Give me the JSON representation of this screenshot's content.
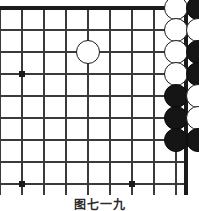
{
  "figure": {
    "kind": "go-board-diagram",
    "width": 199,
    "height": 211,
    "caption": "图七一九",
    "background_color": "#ffffff"
  },
  "board": {
    "line_color": "#3a3a3a",
    "edge_color": "#1a1a1a",
    "star_point_color": "#1a1a1a",
    "cell_size": 22,
    "origin_x": 0,
    "origin_y": 8,
    "columns": 10,
    "rows": 9,
    "edges": {
      "top": true,
      "right": true,
      "left": false,
      "bottom": false
    },
    "star_points": [
      {
        "col": 1,
        "row": 3,
        "x": 22,
        "row_y": 74
      },
      {
        "col": 1,
        "row": 8,
        "x": 22,
        "row_y": 184
      },
      {
        "col": 6,
        "row": 8,
        "x": 132,
        "row_y": 184
      }
    ]
  },
  "stones": [
    {
      "color": "white",
      "col": 8,
      "row": 0,
      "x": 176,
      "y": 8,
      "label": ""
    },
    {
      "color": "black",
      "col": 9,
      "row": 0,
      "x": 198,
      "y": 8,
      "label": ""
    },
    {
      "color": "black",
      "col": 10,
      "row": 0,
      "x": 220,
      "y": 8,
      "label": ""
    },
    {
      "color": "white",
      "col": 8,
      "row": 1,
      "x": 176,
      "y": 30,
      "label": ""
    },
    {
      "color": "white",
      "col": 9,
      "row": 1,
      "x": 198,
      "y": 30,
      "label": ""
    },
    {
      "color": "black",
      "col": 10,
      "row": 1,
      "x": 220,
      "y": 30,
      "label": ""
    },
    {
      "color": "black",
      "col": 11,
      "row": 1,
      "x": 242,
      "y": 30,
      "label": ""
    },
    {
      "color": "white",
      "col": 4,
      "row": 2,
      "x": 88,
      "y": 52,
      "label": ""
    },
    {
      "color": "white",
      "col": 8,
      "row": 2,
      "x": 176,
      "y": 52,
      "label": ""
    },
    {
      "color": "black",
      "col": 9,
      "row": 2,
      "x": 198,
      "y": 52,
      "label": ""
    },
    {
      "color": "black",
      "col": 10,
      "row": 2,
      "x": 220,
      "y": 52,
      "label": ""
    },
    {
      "color": "white",
      "col": 8,
      "row": 3,
      "x": 176,
      "y": 74,
      "label": ""
    },
    {
      "color": "black",
      "col": 9,
      "row": 3,
      "x": 198,
      "y": 74,
      "label": ""
    },
    {
      "color": "white",
      "col": 10,
      "row": 3,
      "x": 220,
      "y": 74,
      "label": ""
    },
    {
      "color": "white",
      "col": 11,
      "row": 3,
      "x": 242,
      "y": 74,
      "label": ""
    },
    {
      "color": "black",
      "col": 8,
      "row": 4,
      "x": 176,
      "y": 96,
      "label": ""
    },
    {
      "color": "white",
      "col": 9,
      "row": 4,
      "x": 198,
      "y": 96,
      "label": ""
    },
    {
      "color": "white",
      "col": 11,
      "row": 4,
      "x": 242,
      "y": 96,
      "label": ""
    },
    {
      "color": "black",
      "col": 8,
      "row": 5,
      "x": 176,
      "y": 118,
      "label": ""
    },
    {
      "color": "white",
      "col": 9,
      "row": 5,
      "x": 198,
      "y": 118,
      "label": ""
    },
    {
      "color": "white",
      "col": 10,
      "row": 5,
      "x": 220,
      "y": 118,
      "label": ""
    },
    {
      "color": "white",
      "col": 11,
      "row": 5,
      "x": 242,
      "y": 118,
      "label": ""
    },
    {
      "color": "black",
      "col": 8,
      "row": 6,
      "x": 176,
      "y": 140,
      "label": ""
    },
    {
      "color": "black",
      "col": 9,
      "row": 6,
      "x": 198,
      "y": 140,
      "label": ""
    },
    {
      "color": "black",
      "col": 10,
      "row": 6,
      "x": 220,
      "y": 140,
      "label": ""
    },
    {
      "color": "black",
      "col": 11,
      "row": 6,
      "x": 242,
      "y": 140,
      "label": "1"
    }
  ],
  "empty_marked_intersections": [
    {
      "col": 10,
      "row": 4,
      "note": "empty point surrounded by white stones"
    }
  ]
}
